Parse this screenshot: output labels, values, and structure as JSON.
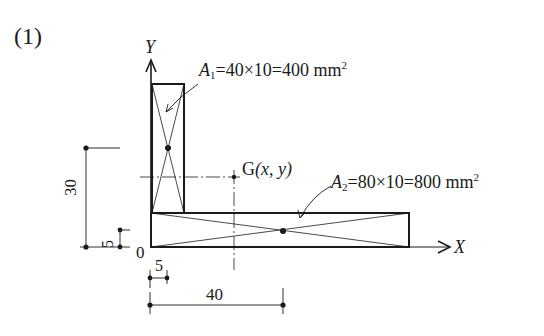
{
  "figure": {
    "label": "(1)"
  },
  "axes": {
    "y_label": "Y",
    "x_label": "X",
    "origin_label": "0"
  },
  "areas": [
    {
      "name": "A",
      "sub": "1",
      "expr": "=40×10=400 mm",
      "sup": "2"
    },
    {
      "name": "A",
      "sub": "2",
      "expr": "=80×10=800 mm",
      "sup": "2"
    }
  ],
  "centroid": {
    "label_prefix": "G",
    "label_coords": "(x, y)"
  },
  "dimensions": {
    "vertical_30": "30",
    "vertical_5": "5",
    "horizontal_5": "5",
    "horizontal_40": "40"
  },
  "colors": {
    "stroke": "#1a1a1a",
    "background": "#ffffff"
  }
}
